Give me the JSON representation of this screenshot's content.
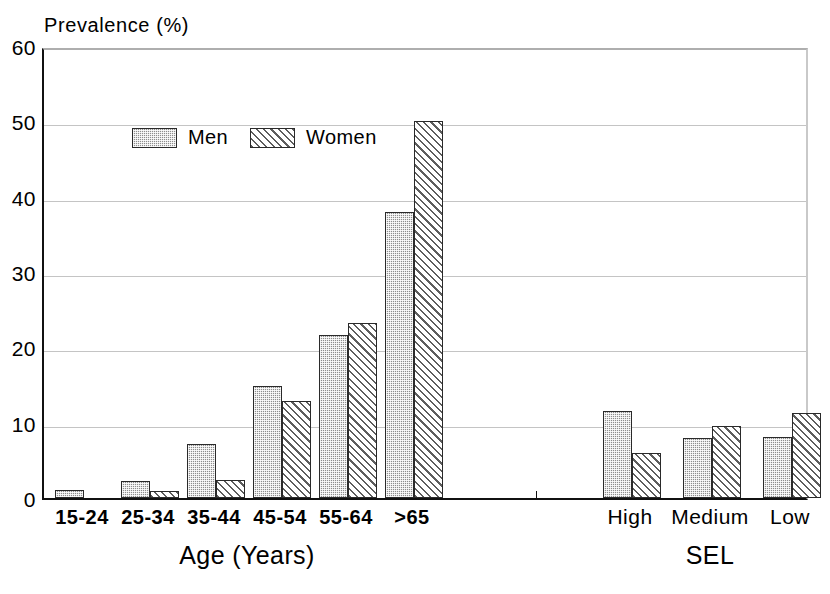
{
  "chart_data": {
    "type": "bar",
    "title": "",
    "ylabel": "Prevalence (%)",
    "xlabel": "",
    "ylim": [
      0,
      60
    ],
    "ytick_step": 10,
    "yticks": [
      60,
      50,
      40,
      30,
      20,
      10,
      0
    ],
    "grid": true,
    "legend_position": "top-left inside plot",
    "legend": [
      "Men",
      "Women"
    ],
    "series": [
      {
        "name": "Men",
        "pattern": "dotted-fill",
        "color": "#8e8e8e",
        "values": [
          1.0,
          2.2,
          7.2,
          14.9,
          21.7,
          38.0,
          11.6,
          8.0,
          8.1
        ]
      },
      {
        "name": "Women",
        "pattern": "diagonal-hatch",
        "color": "#ffffff",
        "values": [
          0.0,
          0.9,
          2.4,
          12.9,
          23.2,
          50.0,
          6.0,
          9.5,
          11.3
        ]
      }
    ],
    "panels": [
      {
        "axis_title": "Age (Years)",
        "categories": [
          "15-24",
          "25-34",
          "35-44",
          "45-54",
          "55-64",
          ">65"
        ]
      },
      {
        "axis_title": "SEL",
        "categories": [
          "High",
          "Medium",
          "Low"
        ]
      }
    ],
    "categories": [
      "15-24",
      "25-34",
      "35-44",
      "45-54",
      "55-64",
      ">65",
      "High",
      "Medium",
      "Low"
    ]
  }
}
